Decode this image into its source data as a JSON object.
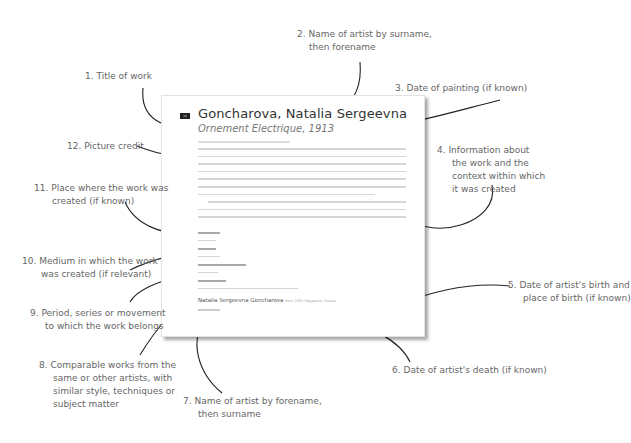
{
  "page": {
    "page_number": "30",
    "title": "Goncharova, Natalia Sergeevna",
    "subtitle": "Ornement Electrique, 1913",
    "artist_name": "Natalia Sergeevna Goncharova",
    "artist_birth": "Born 1881 Nagayevo, Russia",
    "artist_death": "Died 1962"
  },
  "callouts": [
    {
      "num": "1.",
      "lines": [
        "Title of work"
      ]
    },
    {
      "num": "2.",
      "lines": [
        "Name of artist by surname,",
        "then forename"
      ]
    },
    {
      "num": "3.",
      "lines": [
        "Date of painting (if known)"
      ]
    },
    {
      "num": "4.",
      "lines": [
        "Information about",
        "the work and the",
        "context within which",
        "it was created"
      ]
    },
    {
      "num": "5.",
      "lines": [
        "Date of artist's birth and",
        "place of birth (if known)"
      ]
    },
    {
      "num": "6.",
      "lines": [
        "Date of artist's death (if known)"
      ]
    },
    {
      "num": "7.",
      "lines": [
        "Name of artist by forename,",
        "then surname"
      ]
    },
    {
      "num": "8.",
      "lines": [
        "Comparable works from the",
        "same or other artists, with",
        "similar style, techniques or",
        "subject matter"
      ]
    },
    {
      "num": "9.",
      "lines": [
        "Period, series or movement",
        "to which the work belongs"
      ]
    },
    {
      "num": "10.",
      "lines": [
        "Medium in which the work",
        "was created (if relevant)"
      ]
    },
    {
      "num": "11.",
      "lines": [
        "Place where the work was",
        "created (if known)"
      ]
    },
    {
      "num": "12.",
      "lines": [
        "Picture credit"
      ]
    }
  ]
}
